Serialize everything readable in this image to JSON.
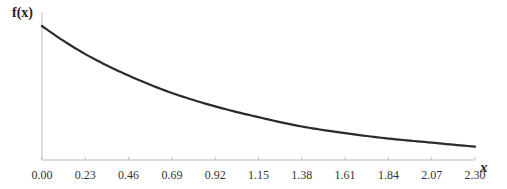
{
  "chart_data": {
    "type": "line",
    "title": "",
    "xlabel": "x",
    "ylabel": "f(x)",
    "xlim": [
      0,
      2.3
    ],
    "ylim": [
      0,
      1.0
    ],
    "grid": false,
    "legend": null,
    "x_ticks": [
      "0.00",
      "0.23",
      "0.46",
      "0.69",
      "0.92",
      "1.15",
      "1.38",
      "1.61",
      "1.84",
      "2.07",
      "2.30"
    ],
    "y_ticks": [],
    "series": [
      {
        "name": "f(x)",
        "color": "#2b2b2b",
        "x": [
          0.0,
          0.23,
          0.46,
          0.69,
          0.92,
          1.15,
          1.38,
          1.61,
          1.84,
          2.07,
          2.3
        ],
        "values": [
          1.0,
          0.79,
          0.63,
          0.5,
          0.4,
          0.32,
          0.25,
          0.2,
          0.16,
          0.13,
          0.1
        ]
      }
    ]
  },
  "layout": {
    "plot_left": 42,
    "plot_right": 475,
    "plot_top": 26,
    "baseline": 160,
    "axis_color": "#bdbdbd",
    "line_color": "#2b2b2b"
  }
}
